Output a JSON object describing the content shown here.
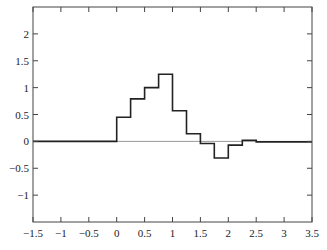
{
  "chart_data": {
    "type": "line",
    "subtype": "step",
    "title": "",
    "xlabel": "",
    "ylabel": "",
    "xlim": [
      -1.5,
      3.5
    ],
    "ylim": [
      -1.5,
      2.5
    ],
    "grid": false,
    "legend": null,
    "x_ticks": [
      -1.5,
      -1,
      -0.5,
      0,
      0.5,
      1,
      1.5,
      2,
      2.5,
      3,
      3.5
    ],
    "x_tick_labels": [
      "−1.5",
      "−1",
      "−0.5",
      "0",
      "0.5",
      "1",
      "1.5",
      "2",
      "2.5",
      "3",
      "3.5"
    ],
    "y_ticks": [
      -1,
      -0.5,
      0,
      0.5,
      1,
      1.5,
      2
    ],
    "y_tick_labels": [
      "−1",
      "−0.5",
      "0",
      "0.5",
      "1",
      "1.5",
      "2"
    ],
    "reference_line": {
      "y": 0,
      "color": "#999999"
    },
    "series": [
      {
        "name": "step-function",
        "color": "#222222",
        "x_edges": [
          -1.5,
          0,
          0.25,
          0.5,
          0.75,
          1.0,
          1.25,
          1.5,
          1.75,
          2.0,
          2.25,
          2.5,
          3.5
        ],
        "values": [
          0,
          0.45,
          0.79,
          1.0,
          1.25,
          0.57,
          0.14,
          -0.04,
          -0.31,
          -0.07,
          0.02,
          -0.01
        ]
      }
    ]
  }
}
